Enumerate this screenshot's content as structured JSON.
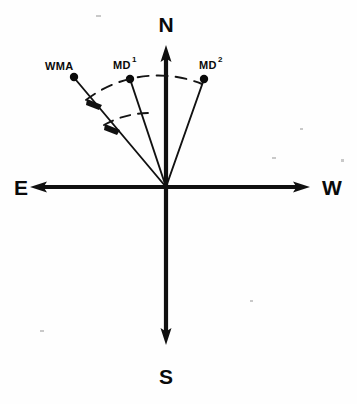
{
  "figure": {
    "background_color": "#fefefe",
    "ink_color": "#101010",
    "width": 357,
    "height": 404
  },
  "compass": {
    "origin": {
      "x": 166,
      "y": 187
    },
    "labels": {
      "north": "N",
      "south": "S",
      "east": "E",
      "west": "W"
    },
    "axes": [
      {
        "name": "north-axis",
        "direction": "up",
        "tip": {
          "x": 166,
          "y": 45
        }
      },
      {
        "name": "south-axis",
        "direction": "down",
        "tip": {
          "x": 166,
          "y": 345
        }
      },
      {
        "name": "east-axis",
        "direction": "left",
        "tip": {
          "x": 30,
          "y": 187
        }
      },
      {
        "name": "west-axis",
        "direction": "right",
        "tip": {
          "x": 310,
          "y": 187
        }
      }
    ]
  },
  "rays": [
    {
      "id": "wma",
      "label": "WMA",
      "superscript": "",
      "endpoint": {
        "x": 74,
        "y": 77
      },
      "label_position": {
        "x": 45,
        "y": 70
      },
      "bearing_from_north_deg": 37
    },
    {
      "id": "md1",
      "label": "MD",
      "superscript": "1",
      "endpoint": {
        "x": 130,
        "y": 79
      },
      "label_position": {
        "x": 113,
        "y": 69
      },
      "bearing_from_north_deg": 18
    },
    {
      "id": "md2",
      "label": "MD",
      "superscript": "2",
      "endpoint": {
        "x": 204,
        "y": 79
      },
      "label_position": {
        "x": 201,
        "y": 69
      },
      "bearing_from_north_deg": 20
    }
  ],
  "arcs": [
    {
      "name": "outer-dashed-arc",
      "description": "dashed arc spanning from the WMA ray across MD-1 to the MD-2 ray",
      "radius": 118,
      "start_ray": "wma",
      "end_ray": "md2",
      "style": "dashed"
    },
    {
      "name": "inner-dashed-arc",
      "description": "short dashed arc between the WMA ray and the MD-1 ray",
      "radius": 93,
      "start_ray": "wma",
      "end_ray": "md1",
      "style": "dashed"
    }
  ],
  "angle_markers": [
    {
      "name": "angle-marker-outer",
      "on_ray": "wma",
      "radius": 118
    },
    {
      "name": "angle-marker-inner",
      "on_ray": "wma",
      "radius": 93
    }
  ]
}
